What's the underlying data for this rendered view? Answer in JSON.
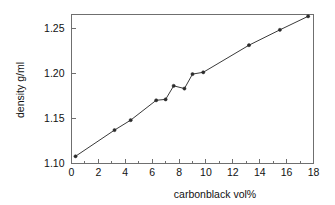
{
  "chart_data": {
    "type": "line",
    "title": "",
    "xlabel": "carbonblack vol%",
    "ylabel": "density g/ml",
    "xlim": [
      0,
      18
    ],
    "ylim": [
      1.1,
      1.265
    ],
    "grid": false,
    "legend": null,
    "x_ticks": [
      "0",
      "2",
      "4",
      "6",
      "8",
      "10",
      "12",
      "14",
      "16",
      "18"
    ],
    "x_tick_values": [
      0,
      2,
      4,
      6,
      8,
      10,
      12,
      14,
      16,
      18
    ],
    "x_minor_tick_values": [
      1,
      3,
      5,
      7,
      9,
      11,
      13,
      15,
      17
    ],
    "y_ticks": [
      "1.10",
      "1.15",
      "1.20",
      "1.25"
    ],
    "y_tick_values": [
      1.1,
      1.15,
      1.2,
      1.25
    ],
    "series": [
      {
        "name": "density vs carbonblack",
        "x": [
          0.3,
          3.2,
          4.4,
          6.3,
          7.0,
          7.6,
          8.4,
          9.0,
          9.8,
          13.2,
          15.5,
          17.6
        ],
        "values": [
          1.108,
          1.137,
          1.148,
          1.17,
          1.171,
          1.186,
          1.183,
          1.199,
          1.201,
          1.231,
          1.248,
          1.263
        ],
        "color": "#3a3a3a",
        "marker": "dot"
      }
    ]
  },
  "axes": {
    "x_axis_label": "carbonblack vol%",
    "y_axis_label": "density g/ml"
  }
}
